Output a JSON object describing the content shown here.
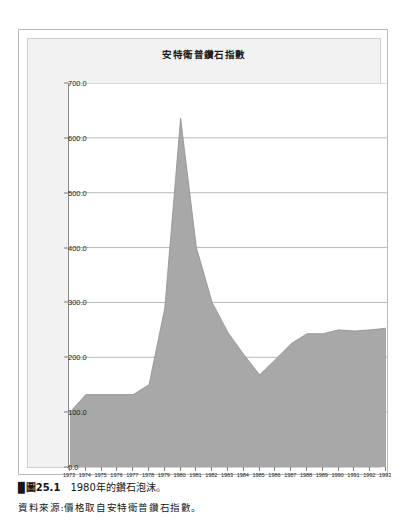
{
  "figure": {
    "title": "安特衛普鑽石指數",
    "caption_number": "圖25.1",
    "caption_text": "1980年的鑽石泡沫。",
    "source_text": "資料來源:價格取自安特衛普鑽石指數。"
  },
  "colors": {
    "area_fill": "#a8a8a8",
    "area_stroke": "#8f8f8f",
    "gridline": "#9a9a9a",
    "axis": "#8a8a8a",
    "panel_bg": "#f2f2f2",
    "plot_bg": "#ffffff",
    "frame_border": "#b9b9b9",
    "text": "#1d1d1d"
  },
  "chart_data": {
    "type": "area",
    "title": "安特衛普鑽石指數",
    "xlabel": "",
    "ylabel": "",
    "ylim": [
      0.0,
      700.0
    ],
    "ytick_labels": [
      "700.0",
      "600.0",
      "500.0",
      "400.0",
      "300.0",
      "200.0",
      "100.0",
      "0.0"
    ],
    "ytick_values": [
      700,
      600,
      500,
      400,
      300,
      200,
      100,
      0
    ],
    "grid": true,
    "legend": "none",
    "categories": [
      "1973",
      "1974",
      "1975",
      "1976",
      "1977",
      "1978",
      "1979",
      "1980",
      "1981",
      "1982",
      "1983",
      "1984",
      "1985",
      "1986",
      "1987",
      "1988",
      "1989",
      "1990",
      "1991",
      "1992",
      "1993"
    ],
    "values": [
      100,
      132,
      132,
      132,
      132,
      150,
      290,
      636,
      400,
      300,
      245,
      205,
      168,
      196,
      225,
      243,
      243,
      250,
      248,
      250,
      253
    ]
  }
}
